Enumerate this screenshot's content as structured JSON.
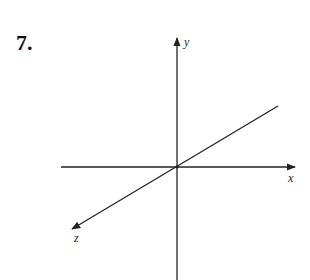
{
  "problem": {
    "number": "7."
  },
  "diagram": {
    "type": "3d-coordinate-axes",
    "axes": [
      {
        "name": "x",
        "label": "x"
      },
      {
        "name": "y",
        "label": "y"
      },
      {
        "name": "z",
        "label": "z"
      }
    ],
    "line_color": "#222222"
  }
}
